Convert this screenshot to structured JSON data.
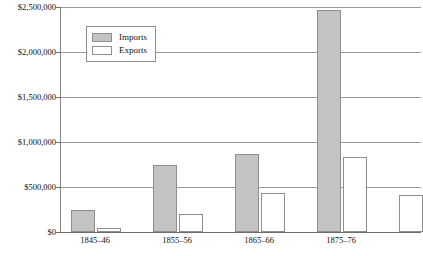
{
  "chart_data": {
    "type": "bar",
    "title": "",
    "subtitle": "",
    "xlabel": "",
    "ylabel": "",
    "categories": [
      "1845–46",
      "1855–56",
      "1865–66",
      "1875–76"
    ],
    "series": [
      {
        "name": "Imports",
        "color": "#c3c3c3",
        "values": [
          250000,
          750000,
          870000,
          2470000
        ]
      },
      {
        "name": "Exports",
        "color": "#ffffff",
        "values": [
          40000,
          200000,
          430000,
          830000
        ]
      }
    ],
    "ylim": [
      0,
      2500000
    ],
    "ytick_values": [
      2500000,
      2000000,
      1500000,
      1000000,
      500000,
      0
    ],
    "ytick_labels": [
      "$2,500,000",
      "$2,000,000",
      "$1,500,000",
      "$1,000,000",
      "$500,000",
      "$0"
    ],
    "grid": true,
    "grid_axis": "y",
    "legend_position": "top-left-inside",
    "clipped_right_edge": true,
    "partial_trailing_bars": [
      {
        "series": "Exports",
        "value": 410000
      }
    ]
  },
  "legend": {
    "entries": [
      {
        "label": "Imports",
        "swatch": "filled-gray-swatch"
      },
      {
        "label": "Exports",
        "swatch": "empty-white-swatch"
      }
    ]
  }
}
